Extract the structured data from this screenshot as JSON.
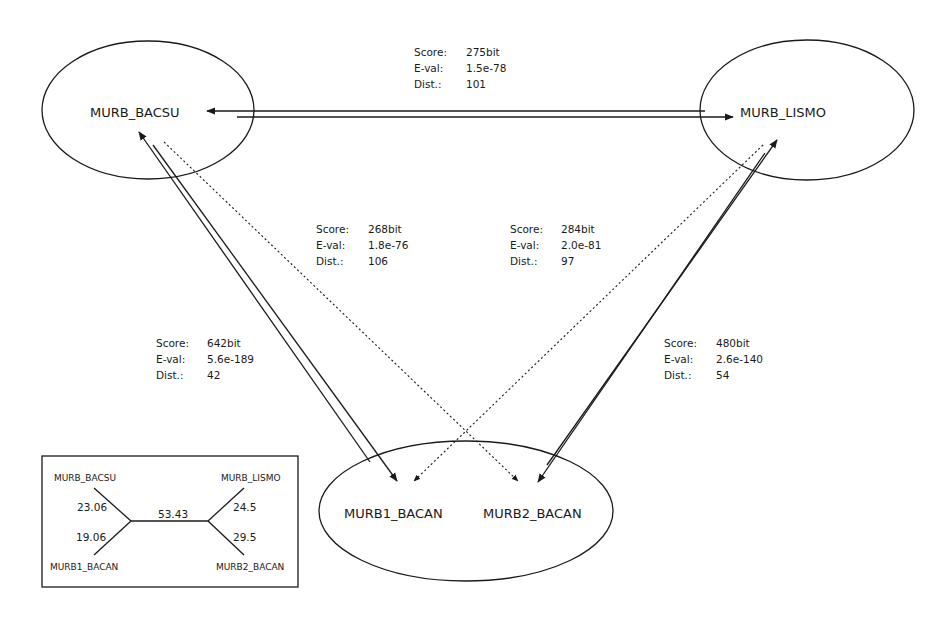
{
  "diagram": {
    "nodes": [
      {
        "id": "MURB_BACSU",
        "label": "MURB_BACSU"
      },
      {
        "id": "MURB_LISMO",
        "label": "MURB_LISMO"
      },
      {
        "id": "MURB1_BACAN",
        "label": "MURB1_BACAN"
      },
      {
        "id": "MURB2_BACAN",
        "label": "MURB2_BACAN"
      }
    ],
    "stat_labels": {
      "score": "Score:",
      "eval": "E-val:",
      "dist": "Dist.:"
    },
    "edges": [
      {
        "from": "MURB_BACSU",
        "to": "MURB_LISMO",
        "style": "double-solid",
        "score": "275bit",
        "eval": "1.5e-78",
        "dist": "101"
      },
      {
        "from": "MURB_BACSU",
        "to": "MURB2_BACAN",
        "style": "dotted",
        "score": "268bit",
        "eval": "1.8e-76",
        "dist": "106"
      },
      {
        "from": "MURB_LISMO",
        "to": "MURB1_BACAN",
        "style": "dotted",
        "score": "284bit",
        "eval": "2.0e-81",
        "dist": "97"
      },
      {
        "from": "MURB_BACSU",
        "to": "MURB1_BACAN",
        "style": "double-solid",
        "score": "642bit",
        "eval": "5.6e-189",
        "dist": "42"
      },
      {
        "from": "MURB_LISMO",
        "to": "MURB2_BACAN",
        "style": "double-solid",
        "score": "480bit",
        "eval": "2.6e-140",
        "dist": "54"
      }
    ],
    "tree": {
      "leaves": {
        "top_left": "MURB_BACSU",
        "bottom_left": "MURB1_BACAN",
        "top_right": "MURB_LISMO",
        "bottom_right": "MURB2_BACAN"
      },
      "branch_lengths": {
        "top_left": "23.06",
        "bottom_left": "19.06",
        "internal": "53.43",
        "top_right": "24.5",
        "bottom_right": "29.5"
      }
    }
  }
}
